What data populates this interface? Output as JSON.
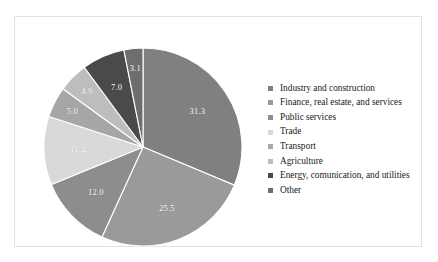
{
  "chart_data": {
    "type": "pie",
    "title": "",
    "subtitle": "",
    "xlabel": "",
    "ylabel": "",
    "grid": false,
    "legend_position": "right",
    "units": "percent",
    "start_angle_deg": -90,
    "direction": "clockwise",
    "categories": [
      "Industry and construction",
      "Finance, real estate, and services",
      "Public services",
      "Trade",
      "Transport",
      "Agriculture",
      "Energy, comunication, and utilities",
      "Other"
    ],
    "values": [
      31.3,
      25.5,
      12.0,
      11.2,
      5.0,
      4.9,
      7.0,
      3.1
    ],
    "value_labels": [
      "31.3",
      "25.5",
      "12.0",
      "11.2",
      "5.0",
      "4.9",
      "7.0",
      "3.1"
    ],
    "colors": [
      "#808080",
      "#9a9a9a",
      "#8d8d8d",
      "#d9d9d9",
      "#a6a6a6",
      "#bdbdbd",
      "#4a4a4a",
      "#6e6e6e"
    ],
    "slices": [
      {
        "label": "Industry and construction",
        "value": 31.3,
        "value_label": "31.3",
        "color": "#808080"
      },
      {
        "label": "Finance, real estate, and services",
        "value": 25.5,
        "value_label": "25.5",
        "color": "#9a9a9a"
      },
      {
        "label": "Public services",
        "value": 12.0,
        "value_label": "12.0",
        "color": "#8d8d8d"
      },
      {
        "label": "Trade",
        "value": 11.2,
        "value_label": "11.2",
        "color": "#d9d9d9"
      },
      {
        "label": "Transport",
        "value": 5.0,
        "value_label": "5.0",
        "color": "#a6a6a6"
      },
      {
        "label": "Agriculture",
        "value": 4.9,
        "value_label": "4.9",
        "color": "#bdbdbd"
      },
      {
        "label": "Energy, comunication, and utilities",
        "value": 7.0,
        "value_label": "7.0",
        "color": "#4a4a4a"
      },
      {
        "label": "Other",
        "value": 3.1,
        "value_label": "3.1",
        "color": "#6e6e6e"
      }
    ]
  },
  "legend": {
    "items": [
      {
        "label": "Industry and construction",
        "color": "#808080"
      },
      {
        "label": "Finance, real estate, and services",
        "color": "#9a9a9a"
      },
      {
        "label": "Public services",
        "color": "#8d8d8d"
      },
      {
        "label": "Trade",
        "color": "#d9d9d9"
      },
      {
        "label": "Transport",
        "color": "#a6a6a6"
      },
      {
        "label": "Agriculture",
        "color": "#bdbdbd"
      },
      {
        "label": "Energy, comunication, and utilities",
        "color": "#4a4a4a"
      },
      {
        "label": "Other",
        "color": "#6e6e6e"
      }
    ]
  },
  "frame": {
    "border_color": "#e2e2e2",
    "background": "#ffffff"
  }
}
